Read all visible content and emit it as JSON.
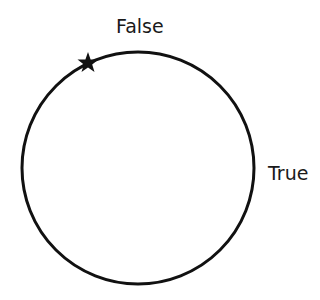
{
  "diagram": {
    "type": "state-cycle",
    "circle": {
      "cx": 138,
      "cy": 168,
      "r": 116,
      "stroke": "#111111",
      "stroke_width": 3
    },
    "marker": {
      "icon": "star-icon",
      "position": "upper-left on circle",
      "color": "#111111"
    },
    "labels": {
      "top": "False",
      "right": "True"
    }
  }
}
